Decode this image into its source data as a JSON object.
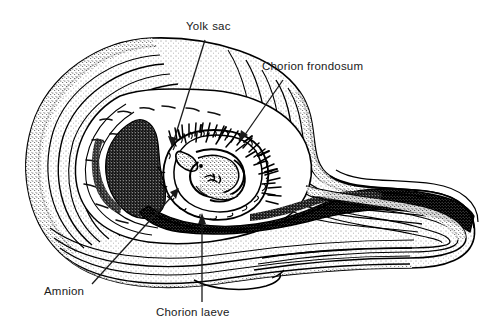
{
  "figure": {
    "background_color": "#ffffff",
    "ink_color": "#000000",
    "text_color": "#1a1a1a",
    "width": 486,
    "height": 329
  },
  "labels": [
    {
      "id": "yolk-sac",
      "text": "Yolk  sac",
      "word1": "Yolk",
      "word2": "sac",
      "text_x": 186,
      "text_y": 21,
      "leader_from": [
        205,
        40
      ],
      "leader_to": [
        172,
        145
      ],
      "arrowhead": true
    },
    {
      "id": "chorion-frondosum",
      "text": "Chorion frondosum",
      "text_x": 262,
      "text_y": 61,
      "leader_from": [
        283,
        80
      ],
      "leader_to": [
        240,
        140
      ],
      "arrowhead": true
    },
    {
      "id": "amnion",
      "text": "Amnion",
      "text_x": 44,
      "text_y": 286,
      "leader_from": [
        92,
        284
      ],
      "leader_to": [
        178,
        190
      ],
      "arrowhead": true
    },
    {
      "id": "chorion-laeve",
      "text": "Chorion laeve",
      "text_x": 156,
      "text_y": 307,
      "leader_from": [
        202,
        302
      ],
      "leader_to": [
        202,
        214
      ],
      "arrowhead": true
    }
  ],
  "structures": [
    {
      "id": "uterine-wall",
      "name": "uterine wall layers",
      "style": "stippled concentric bands"
    },
    {
      "id": "decidua-mass",
      "name": "dark decidual / clot mass",
      "style": "dense black stipple"
    },
    {
      "id": "chorionic-cavity",
      "name": "chorionic cavity",
      "style": "light open region"
    },
    {
      "id": "amniotic-sac",
      "name": "amniotic sac around embryo",
      "style": "closed oval outline"
    },
    {
      "id": "embryo",
      "name": "curled embryo",
      "style": "solid curved body with stipple"
    },
    {
      "id": "yolk-sac-vesicle",
      "name": "yolk sac vesicle",
      "style": "small elongated sac"
    },
    {
      "id": "chorionic-villi",
      "name": "chorionic villi (frondosum)",
      "style": "dense branching spikes"
    },
    {
      "id": "chorion-laeve-band",
      "name": "smooth chorion band",
      "style": "thin scalloped outline"
    },
    {
      "id": "cervical-canal",
      "name": "lower uterine / cervical region",
      "style": "flowing layered lines with dark band"
    }
  ]
}
